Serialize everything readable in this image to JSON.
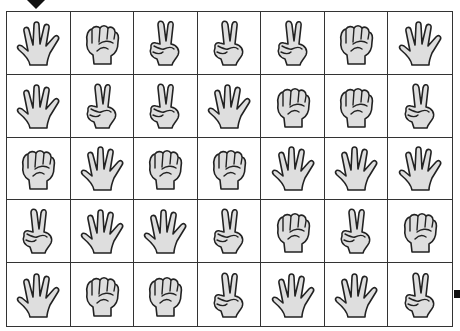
{
  "puzzle": {
    "type": "janken-maze",
    "rows": 5,
    "cols": 7,
    "start_marker": {
      "row": 0,
      "col": 0,
      "position": "top",
      "icon": "down-arrow-icon"
    },
    "goal_marker": {
      "row": 4,
      "col": 6,
      "position": "right",
      "icon": "square-marker-icon"
    },
    "grid": [
      [
        "paper",
        "rock",
        "scissors",
        "scissors",
        "scissors",
        "rock",
        "paper"
      ],
      [
        "paper",
        "scissors",
        "scissors",
        "paper",
        "rock",
        "rock",
        "scissors"
      ],
      [
        "rock",
        "paper",
        "rock",
        "rock",
        "paper",
        "paper",
        "paper"
      ],
      [
        "scissors",
        "paper",
        "paper",
        "scissors",
        "rock",
        "scissors",
        "rock"
      ],
      [
        "paper",
        "rock",
        "rock",
        "scissors",
        "paper",
        "paper",
        "scissors"
      ]
    ]
  },
  "colors": {
    "hand_fill": "#dedede",
    "outline": "#222222",
    "grid_line": "#333333",
    "background": "#ffffff"
  }
}
